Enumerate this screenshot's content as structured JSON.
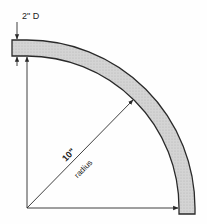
{
  "diagram": {
    "type": "quarter-circle pipe bend dimension drawing",
    "labels": {
      "diameter": "2\" D",
      "radius_value": "10\"",
      "radius_word": "radius"
    },
    "geometry": {
      "center": [
        27,
        208
      ],
      "inner_radius_px": 152,
      "outer_radius_px": 168
    },
    "colors": {
      "stroke": "#2a2a2a",
      "fill": "#cfcfcf",
      "background": "#fefefe"
    }
  }
}
